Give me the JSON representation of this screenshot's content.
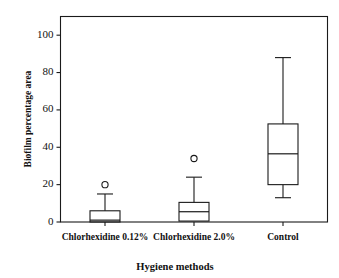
{
  "chart_data": {
    "type": "box",
    "title": "",
    "xlabel": "Hygiene methods",
    "ylabel": "Biofilm percentage area",
    "categories": [
      "Chlorhexidine 0.12%",
      "Chlorhexidine 2.0%",
      "Control"
    ],
    "ylim": [
      0,
      110
    ],
    "yticks": [
      0,
      20,
      40,
      60,
      80,
      100
    ],
    "ytick_labels": [
      "0",
      "20",
      "40",
      "60",
      "80",
      "100"
    ],
    "grid": false,
    "legend": "none",
    "frame": "box",
    "series": [
      {
        "name": "Chlorhexidine 0.12%",
        "whisker_low": 0,
        "q1": 0,
        "median": 1,
        "q3": 6,
        "whisker_high": 15,
        "outliers": [
          20
        ]
      },
      {
        "name": "Chlorhexidine 2.0%",
        "whisker_low": 0.5,
        "q1": 0.5,
        "median": 5.5,
        "q3": 10.5,
        "whisker_high": 24,
        "outliers": [
          34
        ]
      },
      {
        "name": "Control",
        "whisker_low": 13,
        "q1": 20,
        "median": 36.5,
        "q3": 52.5,
        "whisker_high": 88,
        "outliers": []
      }
    ]
  },
  "axis": {
    "y_title": "Biofilm percentage area",
    "x_title": "Hygiene methods",
    "y_labels": [
      "100",
      "80",
      "60",
      "40",
      "20",
      "0"
    ],
    "x_labels": [
      "Chlorhexidine 0.12%",
      "Chlorhexidine 2.0%",
      "Control"
    ]
  },
  "colors": {
    "line": "#1a1a1a",
    "background": "#ffffff",
    "text": "#111111"
  }
}
